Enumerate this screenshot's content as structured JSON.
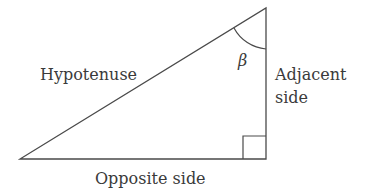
{
  "diagram": {
    "type": "right-triangle",
    "labels": {
      "hypotenuse": "Hypotenuse",
      "adjacent_line1": "Adjacent",
      "adjacent_line2": "side",
      "opposite": "Opposite side",
      "angle": "β"
    },
    "colors": {
      "stroke": "#4a4a4a",
      "text": "#3a3a3a",
      "background": "#ffffff"
    }
  }
}
